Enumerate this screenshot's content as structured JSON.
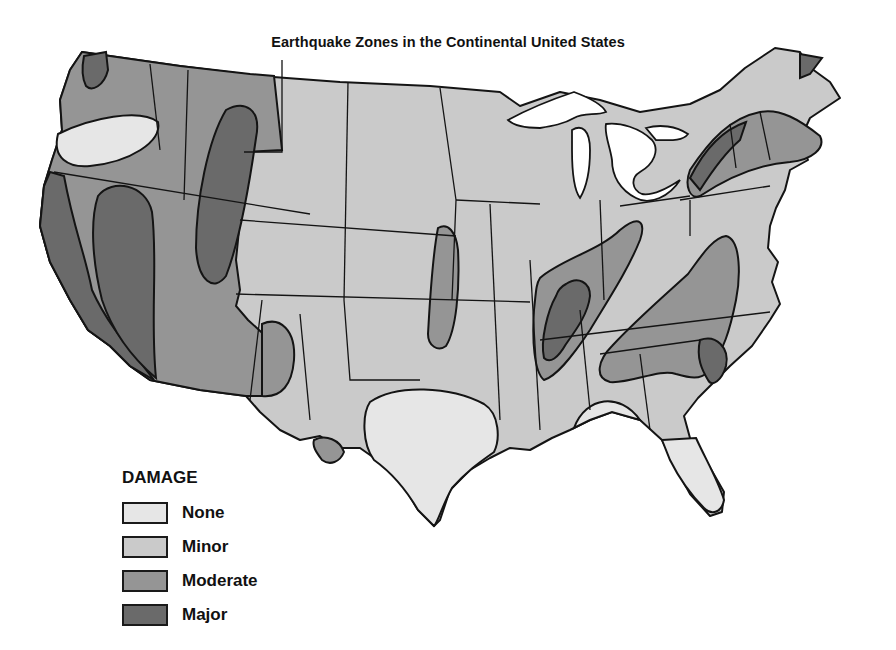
{
  "title": "Earthquake Zones in the Continental United States",
  "legend": {
    "title": "DAMAGE",
    "items": [
      {
        "label": "None",
        "color": "#e6e6e6"
      },
      {
        "label": "Minor",
        "color": "#cacaca"
      },
      {
        "label": "Moderate",
        "color": "#959595"
      },
      {
        "label": "Major",
        "color": "#6a6a6a"
      }
    ]
  },
  "colors": {
    "none": "#e6e6e6",
    "minor": "#cacaca",
    "moderate": "#959595",
    "major": "#6a6a6a",
    "outline": "#141414",
    "water": "#ffffff"
  }
}
